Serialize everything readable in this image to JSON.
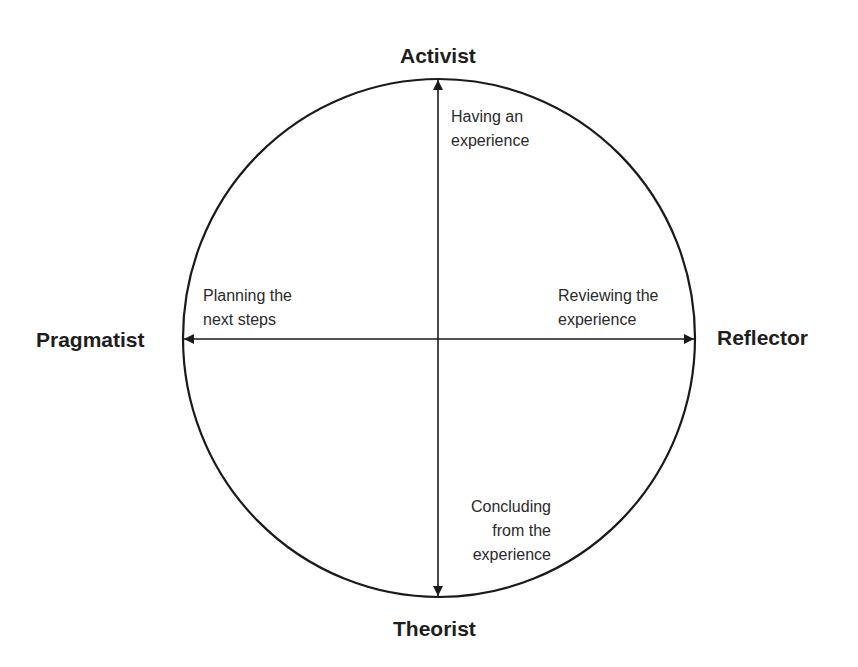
{
  "diagram": {
    "type": "learning-styles-cycle",
    "colors": {
      "stroke": "#1a1a1a",
      "text": "#2a2a2a",
      "background": "#ffffff"
    },
    "roles": {
      "top": "Activist",
      "right": "Reflector",
      "bottom": "Theorist",
      "left": "Pragmatist"
    },
    "stages": {
      "top": {
        "line1": "Having an",
        "line2": "experience"
      },
      "right": {
        "line1": "Reviewing the",
        "line2": "experience"
      },
      "bottom": {
        "line1": "Concluding",
        "line2": "from the",
        "line3": "experience"
      },
      "left": {
        "line1": "Planning the",
        "line2": "next steps"
      }
    }
  }
}
